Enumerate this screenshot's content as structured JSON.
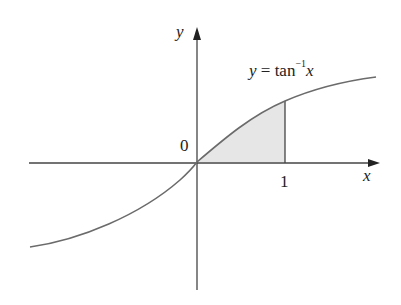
{
  "figure": {
    "function_label_y": "y",
    "function_label_eq": " = tan",
    "function_label_exp": "−1",
    "function_label_x": "x",
    "axis_x_label": "x",
    "axis_y_label": "y",
    "origin_label": "0",
    "tick_label_1": "1",
    "shaded_region": "area under y = tan⁻¹x from x = 0 to x = 1",
    "colors": {
      "curve": "#6b6b6b",
      "axis": "#444444",
      "shade": "#e6e6e6"
    }
  }
}
